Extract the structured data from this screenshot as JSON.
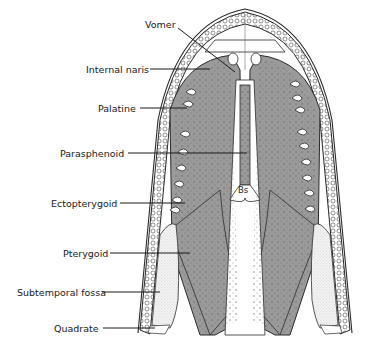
{
  "diagram": {
    "colors": {
      "bone": "#9a9a9a",
      "outline": "#2a2a2a",
      "tooth_fill": "#ffffff",
      "fossa": "#f2f2f2",
      "background": "#ffffff"
    },
    "labels": [
      {
        "id": "vomer",
        "text": "Vomer"
      },
      {
        "id": "internal-naris",
        "text": "Internal naris"
      },
      {
        "id": "palatine",
        "text": "Palatine"
      },
      {
        "id": "parasphenoid",
        "text": "Parasphenoid"
      },
      {
        "id": "ectopterygoid",
        "text": "Ectopterygoid"
      },
      {
        "id": "pterygoid",
        "text": "Pterygoid"
      },
      {
        "id": "subtemporal-fossa",
        "text": "Subtemporal fossa"
      },
      {
        "id": "quadrate",
        "text": "Quadrate"
      }
    ],
    "inner_label": {
      "id": "basisphenoid",
      "text": "Bs"
    }
  }
}
